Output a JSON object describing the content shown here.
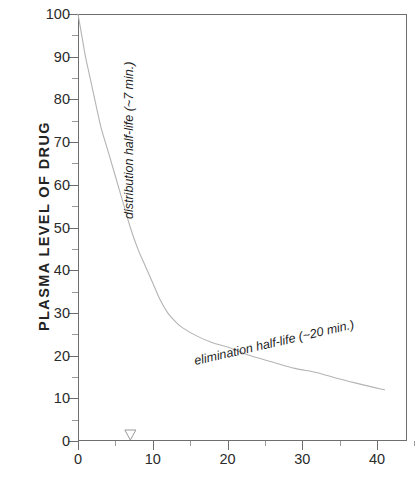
{
  "chart_data": {
    "type": "line",
    "title": "",
    "xlabel": "",
    "ylabel": "PLASMA  LEVEL  OF  DRUG",
    "xlim": [
      0,
      44
    ],
    "ylim": [
      0,
      100
    ],
    "xticks": [
      "0",
      "10",
      "20",
      "30",
      "40"
    ],
    "xtick_values": [
      0,
      10,
      20,
      30,
      40
    ],
    "yticks": [
      "0",
      "10",
      "20",
      "30",
      "40",
      "50",
      "60",
      "70",
      "80",
      "90",
      "100"
    ],
    "ytick_values": [
      0,
      10,
      20,
      30,
      40,
      50,
      60,
      70,
      80,
      90,
      100
    ],
    "grid": false,
    "legend": "none",
    "line_color": "#b4b4b4",
    "axis_color": "#6e6e6e",
    "series": [
      {
        "name": "plasma drug concentration",
        "x": [
          0,
          0.5,
          1,
          1.5,
          2,
          3,
          4,
          5,
          6,
          7,
          8,
          9,
          10,
          11,
          12,
          13,
          14,
          16,
          18,
          20,
          23,
          26,
          29,
          32,
          35,
          38,
          41
        ],
        "values": [
          100,
          95,
          90,
          86,
          82,
          74,
          68,
          62,
          56,
          50,
          45,
          41,
          37,
          33,
          30,
          28,
          26.5,
          24.5,
          23,
          22,
          20,
          18.5,
          17,
          16,
          14.5,
          13.2,
          12
        ]
      }
    ],
    "annotations": [
      {
        "name": "distribution-half-life",
        "text": "distribution half-life (~7 min.)",
        "rotation": -90,
        "style": "italic",
        "at_x": 7
      },
      {
        "name": "elimination-half-life",
        "text": "elimination half-life (~20 min.)",
        "rotation": -13,
        "style": "italic",
        "at_x": 22
      }
    ],
    "markers": [
      {
        "name": "distribution-half-life-marker",
        "shape": "triangle-down-open",
        "x": 7,
        "y": 0
      }
    ]
  }
}
